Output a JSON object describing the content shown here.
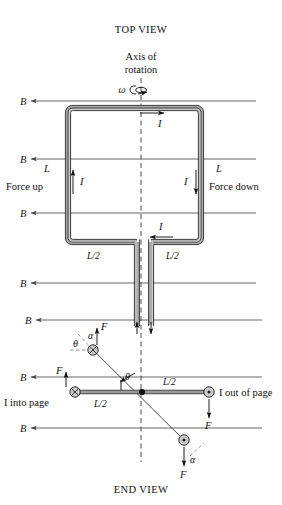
{
  "figure": {
    "top_view_title": "TOP VIEW",
    "end_view_title": "END VIEW",
    "axis_label_line1": "Axis of",
    "axis_label_line2": "rotation",
    "omega_symbol": "ω"
  },
  "field": {
    "b_label": "B",
    "lines_y": [
      101,
      159,
      213,
      283,
      320,
      377,
      428
    ],
    "color": "#555555",
    "direction": "leftward"
  },
  "top_view": {
    "current_label": "I",
    "side_length_label": "L",
    "half_length_label": "L/2",
    "force_up_label": "Force up",
    "force_down_label": "Force down",
    "loop": {
      "left_x": 68,
      "right_x": 201,
      "top_y": 108,
      "bottom_y": 242
    },
    "current_arrows": [
      {
        "name": "top-segment",
        "direction": "right"
      },
      {
        "name": "right-segment",
        "direction": "down"
      },
      {
        "name": "bottom-segment",
        "direction": "left"
      },
      {
        "name": "left-segment",
        "direction": "up"
      }
    ]
  },
  "end_view": {
    "force_label": "F",
    "theta_symbol": "θ",
    "alpha_symbol": "α",
    "half_length_label": "L/2",
    "into_page_label": "I into page",
    "out_of_page_label": "I out of page",
    "into_page_symbol": "⊗",
    "out_of_page_symbol": "⊙",
    "pivot_x": 142,
    "rod_y": 392,
    "left_conductor_x": 75,
    "right_conductor_x": 209,
    "tilted_upper_conductor": {
      "x": 93,
      "y": 350
    },
    "tilted_lower_conductor": {
      "x": 184,
      "y": 440
    }
  },
  "colors": {
    "tube_fill": "#a9a9a9",
    "outline": "#1d1d1d",
    "field_line": "#555555",
    "conductor_circle": "#c9c9c9",
    "background": "#ffffff"
  }
}
